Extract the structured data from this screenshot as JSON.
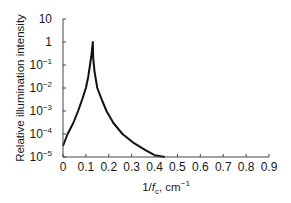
{
  "chart_data": {
    "type": "line",
    "title": "",
    "xlabel": "1/f_c, cm^-1",
    "xlabel_parts": {
      "prefix": "1/",
      "var": "f",
      "sub": "c",
      "suffix": ", cm",
      "sup": "−1"
    },
    "ylabel": "Relative illumination intensity",
    "yscale": "log",
    "xlim": [
      0,
      0.9
    ],
    "ylim": [
      1e-05,
      10
    ],
    "grid": false,
    "legend": null,
    "x_ticks": [
      "0",
      "0.1",
      "0.2",
      "0.3",
      "0.4",
      "0.5",
      "0.6",
      "0.7",
      "0.8",
      "0.9"
    ],
    "y_ticks": [
      {
        "base": "10",
        "exp": ""
      },
      {
        "base": "1",
        "exp": ""
      },
      {
        "base": "10",
        "exp": "−1"
      },
      {
        "base": "10",
        "exp": "−2"
      },
      {
        "base": "10",
        "exp": "−3"
      },
      {
        "base": "10",
        "exp": "−4"
      },
      {
        "base": "10",
        "exp": "−5"
      }
    ],
    "series": [
      {
        "name": "Relative illumination intensity",
        "x": [
          0.0,
          0.02,
          0.045,
          0.066,
          0.085,
          0.1,
          0.11,
          0.118,
          0.125,
          0.13,
          0.132,
          0.138,
          0.15,
          0.17,
          0.19,
          0.22,
          0.26,
          0.31,
          0.36,
          0.4,
          0.445
        ],
        "y": [
          3e-05,
          0.0001,
          0.0003,
          0.001,
          0.0035,
          0.01,
          0.03,
          0.1,
          0.3,
          1.0,
          0.2,
          0.05,
          0.01,
          0.003,
          0.001,
          0.0003,
          0.0001,
          4e-05,
          2e-05,
          1.2e-05,
          1e-05
        ]
      }
    ]
  }
}
